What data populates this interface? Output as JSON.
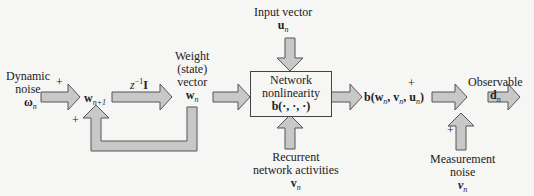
{
  "diagram": {
    "type": "state-space model block diagram",
    "colors": {
      "arrow_fill": "#c8c8c8",
      "arrow_stroke": "#555555",
      "background": "#f6f6f4",
      "text": "#222222"
    },
    "labels": {
      "dynamic_noise_1": "Dynamic",
      "dynamic_noise_2": "noise",
      "omega_n": "ω",
      "omega_sub": "n",
      "plus_1": "+",
      "plus_2": "+",
      "plus_3": "+",
      "plus_4": "+",
      "w_next": "w",
      "w_next_sub": "n+1",
      "delay": "z",
      "delay_sup": "−1",
      "delay_I": "I",
      "weight_1": "Weight",
      "weight_2": "(state)",
      "weight_3": "vector",
      "w_n": "w",
      "w_n_sub": "n",
      "input_vector": "Input vector",
      "u_n": "u",
      "u_n_sub": "n",
      "box_line1": "Network",
      "box_line2": "nonlinearity",
      "box_line3": "b(·, ·, ·)",
      "recurrent_1": "Recurrent",
      "recurrent_2": "network activities",
      "v_n": "v",
      "v_n_sub": "n",
      "output_expr": "b(w",
      "output_expr_rest": ", v",
      "output_expr_rest2": ", u",
      "output_close": ")",
      "observable": "Observable",
      "d_n": "d",
      "d_n_sub": "n",
      "measurement_1": "Measurement",
      "measurement_2": "noise",
      "nu_n": "ν",
      "nu_n_sub": "n",
      "sub_n": "n"
    }
  }
}
